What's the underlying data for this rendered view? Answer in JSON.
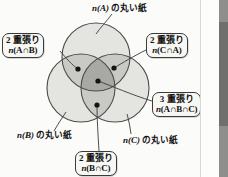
{
  "diagram": {
    "title_label": "n(A) の丸い紙",
    "circles": [
      {
        "id": "A",
        "name": "circle-a",
        "cx": 96,
        "cy": 57,
        "r": 34
      },
      {
        "id": "B",
        "name": "circle-b",
        "cx": 81,
        "cy": 88,
        "r": 34
      },
      {
        "id": "C",
        "name": "circle-c",
        "cx": 115,
        "cy": 88,
        "r": 34
      }
    ],
    "markers": [
      {
        "id": "dot-ab",
        "x": 78,
        "y": 69
      },
      {
        "id": "dot-ca",
        "x": 114,
        "y": 68
      },
      {
        "id": "dot-abc",
        "x": 98,
        "y": 81
      },
      {
        "id": "dot-bc",
        "x": 97,
        "y": 105
      }
    ],
    "callouts": [
      {
        "id": "ab",
        "name": "callout-a-int-b",
        "line1": "2 重張り",
        "line2_pre": "n",
        "line2_body": "(A∩B)"
      },
      {
        "id": "ca",
        "name": "callout-c-int-a",
        "line1": "2 重張り",
        "line2_pre": "n",
        "line2_body": "(C∩A)"
      },
      {
        "id": "abc",
        "name": "callout-a-int-b-int-c",
        "line1": "3 重張り",
        "line2_pre": "n",
        "line2_body": "(A∩B∩C)"
      },
      {
        "id": "bc",
        "name": "callout-b-int-c",
        "line1": "2 重張り",
        "line2_pre": "n",
        "line2_body": "(B∩C)"
      }
    ],
    "labels": [
      {
        "id": "a",
        "name": "label-circle-a",
        "math": "n(A)",
        "text": " の丸い紙"
      },
      {
        "id": "b",
        "name": "label-circle-b",
        "math": "n(B)",
        "text": " の丸い紙"
      },
      {
        "id": "c",
        "name": "label-circle-c",
        "math": "n(C)",
        "text": " の丸い紙"
      }
    ],
    "colors": {
      "circle_fill": "#e3e3e0",
      "circle_stroke": "#4a4a48",
      "overlap_two": "#c9c9c5",
      "overlap_three": "#a9a9a5",
      "marker": "#151515",
      "leader": "#3a3a38",
      "box_fill": "#f7f7f4",
      "box_stroke": "#3a3a38",
      "page_bg": "#fbfbf9"
    }
  }
}
